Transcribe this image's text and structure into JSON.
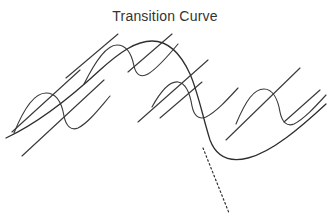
{
  "figure": {
    "title": "Transition Curve",
    "background_color": "#ffffff",
    "stroke_color": "#3a3a3a",
    "main_stroke_color": "#2e2e2e",
    "title_color": "#333333"
  },
  "chart_data": {
    "type": "line",
    "title": "Transition Curve",
    "subtitle": "",
    "xlabel": "",
    "ylabel": "",
    "grid": false,
    "legend": null,
    "axes_visible": false,
    "tick_labels": [],
    "xlim": [
      0,
      330
    ],
    "ylim": [
      223,
      0
    ],
    "annotations": [
      {
        "name": "dotted-tangent",
        "style": "dotted",
        "description": "dotted tangent extending down-right from the descending inflection of the main transition curve"
      }
    ],
    "series": [
      {
        "name": "main-transition-curve",
        "style": "solid",
        "stroke": "#2e2e2e",
        "description": "large smooth arch rising from lower left, peaking near x=150, descending steeply through an inflection then flattening into a trough and rising to the right edge",
        "path": "M 6 138 C 40 122, 72 96, 100 70 C 120 52, 136 41, 152 41 C 168 41, 180 52, 190 74 C 198 92, 203 118, 210 140 C 216 156, 228 163, 248 158 C 272 152, 300 128, 326 104"
      },
      {
        "name": "wiggle-curve-left",
        "style": "solid",
        "stroke": "#3a3a3a",
        "description": "small oscillation: rises to crest near x=48 y=95, dips to trough near x=68 y=128, then climbs away to the upper right",
        "path": "M 14 133 C 24 108, 34 93, 46 93 C 57 93, 62 104, 64 116 C 66 126, 71 131, 78 128 C 88 123, 98 110, 110 96"
      },
      {
        "name": "wiggle-curve-mid",
        "style": "solid",
        "stroke": "#3a3a3a",
        "description": "small oscillation crossing the arch: crest near x=118 y=44, trough near x=138 y=72, rising to the upper right",
        "path": "M 84 84 C 95 62, 106 45, 117 45 C 127 45, 132 56, 134 66 C 136 75, 141 78, 148 74 C 158 68, 168 56, 178 44"
      },
      {
        "name": "wiggle-curve-right-inner",
        "style": "solid",
        "stroke": "#3a3a3a",
        "description": "small oscillation right of centre: crest near x=176 y=84, trough near x=196 y=114, then rising to the right",
        "path": "M 152 107 C 162 89, 170 81, 178 82 C 186 83, 190 94, 192 106 C 194 116, 199 120, 206 117 C 216 112, 227 100, 238 88"
      },
      {
        "name": "wiggle-curve-right-outer",
        "style": "solid",
        "stroke": "#3a3a3a",
        "description": "small oscillation near the right edge: crest near x=264 y=90, trough near x=284 y=124, rising off the right edge",
        "path": "M 236 124 C 246 100, 254 89, 264 89 C 273 89, 278 100, 280 112 C 282 122, 287 127, 294 124 C 304 119, 315 107, 326 95"
      },
      {
        "name": "diagonal-line-upper-left",
        "style": "solid",
        "stroke": "#3a3a3a",
        "description": "straight diagonal segment in the upper-left quadrant",
        "path": "M 66 78 L 118 34"
      },
      {
        "name": "diagonal-line-lower-left",
        "style": "solid",
        "stroke": "#3a3a3a",
        "description": "straight diagonal segment crossing the lower-left wiggle",
        "path": "M 12 132 L 80 70"
      },
      {
        "name": "diagonal-line-left-short",
        "style": "solid",
        "stroke": "#3a3a3a",
        "description": "short straight diagonal segment below the left diagonals",
        "path": "M 22 156 L 104 80"
      },
      {
        "name": "diagonal-line-centre",
        "style": "solid",
        "stroke": "#3a3a3a",
        "description": "straight diagonal segment crossing the arch near its peak",
        "path": "M 128 72 L 172 34"
      },
      {
        "name": "diagonal-line-centre-lower",
        "style": "solid",
        "stroke": "#3a3a3a",
        "description": "straight diagonal crossing the descending limb of the arch",
        "path": "M 138 122 L 208 60"
      },
      {
        "name": "diagonal-line-right-short",
        "style": "solid",
        "stroke": "#3a3a3a",
        "description": "short straight diagonal segment right of centre",
        "path": "M 160 118 L 202 82"
      },
      {
        "name": "diagonal-line-right",
        "style": "solid",
        "stroke": "#3a3a3a",
        "description": "straight diagonal segment crossing the right-hand wiggle",
        "path": "M 226 140 L 300 68"
      },
      {
        "name": "diagonal-line-far-right",
        "style": "solid",
        "stroke": "#3a3a3a",
        "description": "short straight diagonal segment at the far right",
        "path": "M 284 122 L 320 90"
      },
      {
        "name": "dotted-tangent-line",
        "style": "dotted",
        "stroke": "#2e2e2e",
        "description": "dotted straight tangent continuing down-right from the curve's inflection at about (203,148) to (229,213)",
        "path": "M 203 148 L 229 213"
      }
    ]
  }
}
